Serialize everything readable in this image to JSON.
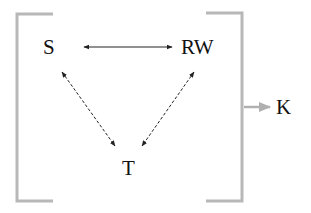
{
  "diagram": {
    "nodes": [
      {
        "id": "S",
        "label": "S"
      },
      {
        "id": "RW",
        "label": "RW"
      },
      {
        "id": "T",
        "label": "T"
      },
      {
        "id": "K",
        "label": "K"
      }
    ],
    "edges": [
      {
        "from": "S",
        "to": "RW",
        "style": "solid",
        "direction": "bidirectional"
      },
      {
        "from": "S",
        "to": "T",
        "style": "dashed",
        "direction": "bidirectional"
      },
      {
        "from": "RW",
        "to": "T",
        "style": "dashed",
        "direction": "bidirectional"
      },
      {
        "from": "bracket-group",
        "to": "K",
        "style": "solid",
        "direction": "forward"
      }
    ],
    "group": {
      "members": [
        "S",
        "RW",
        "T"
      ],
      "shape": "square-brackets"
    },
    "colors": {
      "text": "#111111",
      "arrow": "#222222",
      "bracket": "#b8b8b8"
    }
  }
}
